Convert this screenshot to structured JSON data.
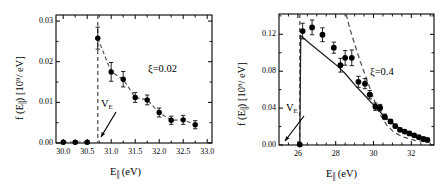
{
  "figure": {
    "type": "two-panel-scientific-plot",
    "background": "#ffffff",
    "ink_color": "#000000",
    "curve_color": "#555555"
  },
  "chart_data": [
    {
      "id": "left-panel",
      "type": "scatter",
      "title": "",
      "xlabel_main": "E",
      "xlabel_sub": "||",
      "xlabel_unit": " (eV)",
      "xlabel_full": "E|| (eV)",
      "ylabel_full": "f (E||) [10^9/ eV]",
      "ylabel_f": "f (E",
      "ylabel_sub": "||",
      "ylabel_mid": ") [10",
      "ylabel_sup": "9",
      "ylabel_tail": "/ eV]",
      "xlim": [
        29.85,
        33.1
      ],
      "ylim": [
        0.0,
        0.0315
      ],
      "xticks": [
        30.0,
        30.5,
        31.0,
        31.5,
        32.0,
        32.5,
        33.0
      ],
      "xticklabels": [
        "30.0",
        "30.5",
        "31.0",
        "31.5",
        "32.0",
        "32.5",
        "33.0"
      ],
      "yticks": [
        0.0,
        0.01,
        0.02,
        0.03
      ],
      "yticklabels": [
        "0.00",
        "0.01",
        "0.02",
        "0.03"
      ],
      "grid": false,
      "legend": false,
      "annotation_xi": "ξ=0.02",
      "annotation_threshold": "V",
      "annotation_threshold_sub": "E",
      "threshold_x": 30.72,
      "marker": "filled-circle",
      "x": [
        30.0,
        30.25,
        30.5,
        30.72,
        31.0,
        31.25,
        31.5,
        31.75,
        32.0,
        32.25,
        32.5,
        32.75
      ],
      "y": [
        0.0002,
        0.0002,
        0.0002,
        0.0258,
        0.0175,
        0.0157,
        0.0112,
        0.0106,
        0.0075,
        0.0056,
        0.0057,
        0.0045
      ],
      "yerr": [
        0.0004,
        0.0004,
        0.0004,
        0.0027,
        0.0023,
        0.0019,
        0.0012,
        0.0012,
        0.0011,
        0.001,
        0.0011,
        0.001
      ],
      "fit_style": "dashed"
    },
    {
      "id": "right-panel",
      "type": "scatter",
      "title": "",
      "xlabel_main": "E",
      "xlabel_sub": "||",
      "xlabel_unit": " (eV)",
      "xlabel_full": "E|| (eV)",
      "ylabel_full": "f (E||) [10^8/ eV]",
      "ylabel_f": "f (E",
      "ylabel_sub": "||",
      "ylabel_mid": ") [10",
      "ylabel_sup": "8",
      "ylabel_tail": "/ eV]",
      "xlim": [
        25.0,
        33.2
      ],
      "ylim": [
        0.0,
        0.142
      ],
      "xticks": [
        26,
        28,
        30,
        32
      ],
      "xticklabels": [
        "26",
        "28",
        "30",
        "32"
      ],
      "yticks": [
        0.0,
        0.04,
        0.08,
        0.12
      ],
      "yticklabels": [
        "0.00",
        "0.04",
        "0.08",
        "0.12"
      ],
      "grid": false,
      "legend": false,
      "annotation_xi": "ξ=0.4",
      "annotation_threshold": "V",
      "annotation_threshold_sub": "E",
      "threshold_x": 26.1,
      "marker": "filled-circle",
      "x": [
        26.1,
        26.25,
        26.75,
        27.3,
        27.9,
        28.25,
        28.5,
        28.85,
        29.2,
        29.55,
        29.8,
        30.1,
        30.35,
        30.6,
        30.9,
        31.15,
        31.4,
        31.65,
        31.9,
        32.15,
        32.4,
        32.65,
        32.85
      ],
      "y": [
        0.0005,
        0.1235,
        0.1275,
        0.1195,
        0.1055,
        0.0865,
        0.0945,
        0.0945,
        0.0685,
        0.0665,
        0.0545,
        0.0415,
        0.0405,
        0.0305,
        0.0255,
        0.0205,
        0.0165,
        0.0145,
        0.0125,
        0.0105,
        0.0085,
        0.0065,
        0.0055
      ],
      "yerr": [
        0.0008,
        0.0085,
        0.008,
        0.0075,
        0.006,
        0.0075,
        0.008,
        0.0085,
        0.006,
        0.0055,
        0.0045,
        0.004,
        0.0035,
        0.003,
        0.0022,
        0.002,
        0.0018,
        0.0016,
        0.0014,
        0.0013,
        0.0012,
        0.0011,
        0.001
      ],
      "solid_curve_x": [
        26.1,
        26.15,
        26.6,
        27.2,
        27.8,
        28.1,
        28.5,
        29.0,
        29.5,
        30.0,
        30.5,
        31.0,
        31.5,
        32.0,
        32.5,
        32.9
      ],
      "solid_curve_y": [
        0.0005,
        0.1185,
        0.1105,
        0.1005,
        0.0905,
        0.0855,
        0.0775,
        0.0655,
        0.0545,
        0.0435,
        0.0325,
        0.0235,
        0.0165,
        0.012,
        0.0085,
        0.006
      ],
      "dashed_curve_x": [
        28.55,
        28.75,
        29.0,
        29.3,
        29.6,
        29.9,
        30.15,
        30.4,
        30.7,
        31.1,
        31.6,
        32.2,
        32.9
      ],
      "dashed_curve_y": [
        0.142,
        0.126,
        0.1095,
        0.0905,
        0.0735,
        0.0565,
        0.0425,
        0.0315,
        0.0215,
        0.0135,
        0.0085,
        0.005,
        0.003
      ],
      "fit_style": "solid-plus-dashed"
    }
  ]
}
